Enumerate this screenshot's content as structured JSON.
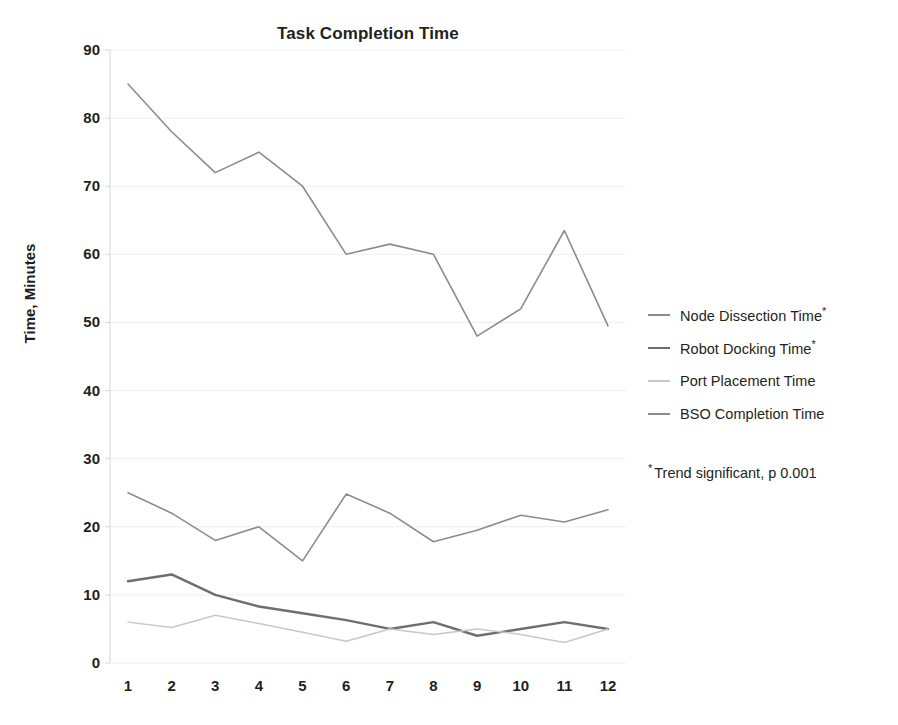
{
  "chart_data": {
    "type": "line",
    "title": "Task Completion Time",
    "xlabel": "",
    "ylabel": "Time, Minutes",
    "x": [
      1,
      2,
      3,
      4,
      5,
      6,
      7,
      8,
      9,
      10,
      11,
      12
    ],
    "categories": [
      "1",
      "2",
      "3",
      "4",
      "5",
      "6",
      "7",
      "8",
      "9",
      "10",
      "11",
      "12"
    ],
    "ylim": [
      0,
      90
    ],
    "yticks": [
      0,
      10,
      20,
      30,
      40,
      50,
      60,
      70,
      80,
      90
    ],
    "ytick_labels": [
      "0",
      "10",
      "20",
      "30",
      "40",
      "50",
      "60",
      "70",
      "80",
      "90"
    ],
    "grid": true,
    "grid_axis": "y",
    "legend_position": "right",
    "series": [
      {
        "name": "Node Dissection Time*",
        "color": "#8c8c8c",
        "values": [
          85,
          78,
          72,
          75,
          70,
          60,
          61.5,
          60,
          48,
          52,
          63.5,
          49.5
        ]
      },
      {
        "name": "Robot Docking Time*",
        "color": "#6e6e6e",
        "values": [
          12,
          13,
          10,
          8.3,
          7.3,
          6.3,
          5,
          6,
          4,
          5,
          6,
          5
        ]
      },
      {
        "name": "Port Placement Time",
        "color": "#c8c8c8",
        "values": [
          6,
          5.2,
          7,
          5.8,
          4.5,
          3.2,
          5,
          4.2,
          5,
          4.2,
          3,
          5
        ]
      },
      {
        "name": "BSO Completion Time",
        "color": "#8c8c8c",
        "values": [
          25,
          22,
          18,
          20,
          15,
          24.8,
          22,
          17.8,
          19.5,
          21.7,
          20.7,
          22.5
        ]
      }
    ],
    "annotations": [
      {
        "text": "Trend significant, p 0.001",
        "marker": "*"
      }
    ]
  },
  "legend": {
    "items": [
      {
        "label": "Node Dissection Time",
        "marker": "*",
        "color": "#8c8c8c"
      },
      {
        "label": "Robot Docking Time",
        "marker": "*",
        "color": "#6e6e6e"
      },
      {
        "label": "Port Placement Time",
        "marker": "",
        "color": "#c8c8c8"
      },
      {
        "label": "BSO Completion Time",
        "marker": "",
        "color": "#8c8c8c"
      }
    ],
    "note": "Trend significant, p 0.001",
    "note_marker": "*"
  },
  "colors": {
    "background": "#ffffff",
    "text": "#231f20",
    "grid": "#ededf2",
    "axis": "#d9d9de"
  }
}
